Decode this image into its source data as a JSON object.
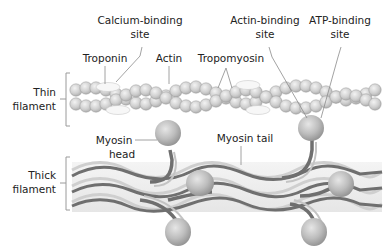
{
  "diagram": {
    "labels": {
      "calcium_binding_site_line1": "Calcium-binding",
      "calcium_binding_site_line2": "site",
      "troponin": "Troponin",
      "actin": "Actin",
      "tropomyosin": "Tropomyosin",
      "actin_binding_site_line1": "Actin-binding",
      "actin_binding_site_line2": "site",
      "atp_binding_site_line1": "ATP-binding",
      "atp_binding_site_line2": "site",
      "thin_filament_line1": "Thin",
      "thin_filament_line2": "filament",
      "myosin_head_line1": "Myosin",
      "myosin_head_line2": "head",
      "myosin_tail": "Myosin tail",
      "thick_filament_line1": "Thick",
      "thick_filament_line2": "filament"
    },
    "colors": {
      "actin_bead": "#c8c8c8",
      "actin_bead_highlight": "#eeeeee",
      "troponin": "#f4f4f4",
      "myosin_dark": "#6e6e6e",
      "myosin_light": "#c4c4c4",
      "myosin_head": "#bdbdbd",
      "thick_bg": "#ececec",
      "leader": "#8a8a8a"
    }
  }
}
